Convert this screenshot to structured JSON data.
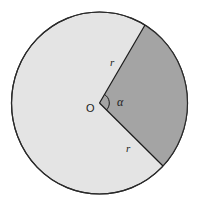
{
  "diagram": {
    "labels": {
      "center": "O",
      "angle": "α",
      "radius_top": "r",
      "radius_bottom": "r"
    },
    "colors": {
      "circle_fill": "#e4e4e4",
      "sector_fill": "#a4a4a4",
      "stroke": "#2a2a2a",
      "background": "#ffffff"
    }
  }
}
